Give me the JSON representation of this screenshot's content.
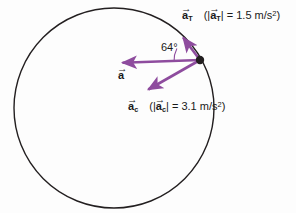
{
  "figure": {
    "background_color": "#fdfdfd",
    "circle": {
      "name": "circular-path",
      "center_x": 114,
      "center_y": 108,
      "radius": 100,
      "stroke_color": "#231f20",
      "stroke_width": 1.4
    },
    "particle_point": {
      "name": "particle-point",
      "x": 200,
      "y": 60,
      "radius": 4.2,
      "color": "#231f20"
    },
    "vector_color": "#8e4c9e"
  },
  "vectors": [
    {
      "id": "tangential",
      "symbol": "a",
      "subscript": "T",
      "magnitude": "1.5",
      "units": "m/s",
      "units_exponent": "2",
      "tail_x": 200,
      "tail_y": 60,
      "tip_x": 181,
      "tip_y": 35,
      "color": "#8e4c9e"
    },
    {
      "id": "resultant",
      "symbol": "a",
      "subscript": "",
      "magnitude": "",
      "units": "",
      "units_exponent": "",
      "tail_x": 200,
      "tail_y": 60,
      "tip_x": 118,
      "tip_y": 63,
      "color": "#8e4c9e"
    },
    {
      "id": "centripetal",
      "symbol": "a",
      "subscript": "c",
      "magnitude": "3.1",
      "units": "m/s",
      "units_exponent": "2",
      "tail_x": 200,
      "tail_y": 60,
      "tip_x": 144,
      "tip_y": 92,
      "color": "#8e4c9e"
    }
  ],
  "labels": {
    "tangential": {
      "symbol": "a",
      "subscript": "T",
      "open_paren": "(",
      "bar_left": "|",
      "bar_right": "|",
      "equals": "=",
      "value": "1.5",
      "units": "m/s",
      "exponent": "2",
      "close_paren": ")"
    },
    "centripetal": {
      "symbol": "a",
      "subscript": "c",
      "open_paren": "(",
      "bar_left": "|",
      "bar_right": "|",
      "equals": "=",
      "value": "3.1",
      "units": "m/s",
      "exponent": "2",
      "close_paren": ")"
    },
    "resultant": {
      "symbol": "a"
    },
    "angle": {
      "value": "64",
      "degree_sign": "°",
      "text": "64°"
    },
    "arrow_accent": "→"
  },
  "angle_arc": {
    "name": "angle-arc-64",
    "center_x": 200,
    "center_y": 60,
    "radius": 26,
    "color": "#8e4c9e"
  }
}
